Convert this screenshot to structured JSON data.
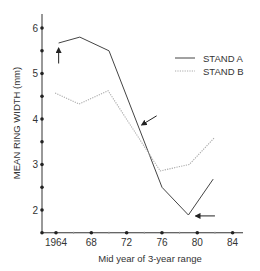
{
  "chart_data": {
    "type": "line",
    "title": "",
    "xlabel": "Mid year of 3-year range",
    "ylabel": "MEAN RING WIDTH (mm)",
    "xlim": [
      1963.2,
      1986
    ],
    "ylim": [
      1.5,
      6.3
    ],
    "x_ticks": [
      1964,
      1968,
      1972,
      1976,
      1980,
      1984
    ],
    "x_tick_labels": [
      "1964",
      "68",
      "72",
      "76",
      "80",
      "84"
    ],
    "x_minor_ticks": [
      1966,
      1970,
      1974,
      1978,
      1982
    ],
    "y_ticks": [
      2,
      3,
      4,
      5,
      6
    ],
    "y_tick_labels": [
      "2",
      "3",
      "4",
      "5",
      "6"
    ],
    "y_minor_ticks": [
      2.5,
      3.5,
      4.5,
      5.5
    ],
    "grid": false,
    "legend_position": "upper right",
    "series": [
      {
        "name": "STAND A",
        "style": "solid",
        "color": "#444444",
        "x": [
          1964.3,
          1966.7,
          1970,
          1976,
          1979,
          1981.8
        ],
        "values": [
          5.67,
          5.8,
          5.5,
          2.5,
          1.89,
          2.68
        ]
      },
      {
        "name": "STAND B",
        "style": "dotted",
        "color": "#aaaaaa",
        "x": [
          1963.9,
          1966.6,
          1969.9,
          1975.8,
          1979.1,
          1981.9
        ],
        "values": [
          4.57,
          4.33,
          4.62,
          2.86,
          3.0,
          3.58
        ]
      }
    ],
    "annotations": [
      {
        "type": "arrow",
        "direction": "up",
        "x": 1964.3,
        "y_from": 5.22,
        "y_to": 5.56
      },
      {
        "type": "arrow",
        "direction": "down-left",
        "x_from": 1975.4,
        "y_from": 4.07,
        "x_to": 1973.7,
        "y_to": 3.87
      },
      {
        "type": "arrow",
        "direction": "left",
        "x_from": 1982,
        "y_from": 1.87,
        "x_to": 1979.8,
        "y_to": 1.87
      }
    ]
  }
}
